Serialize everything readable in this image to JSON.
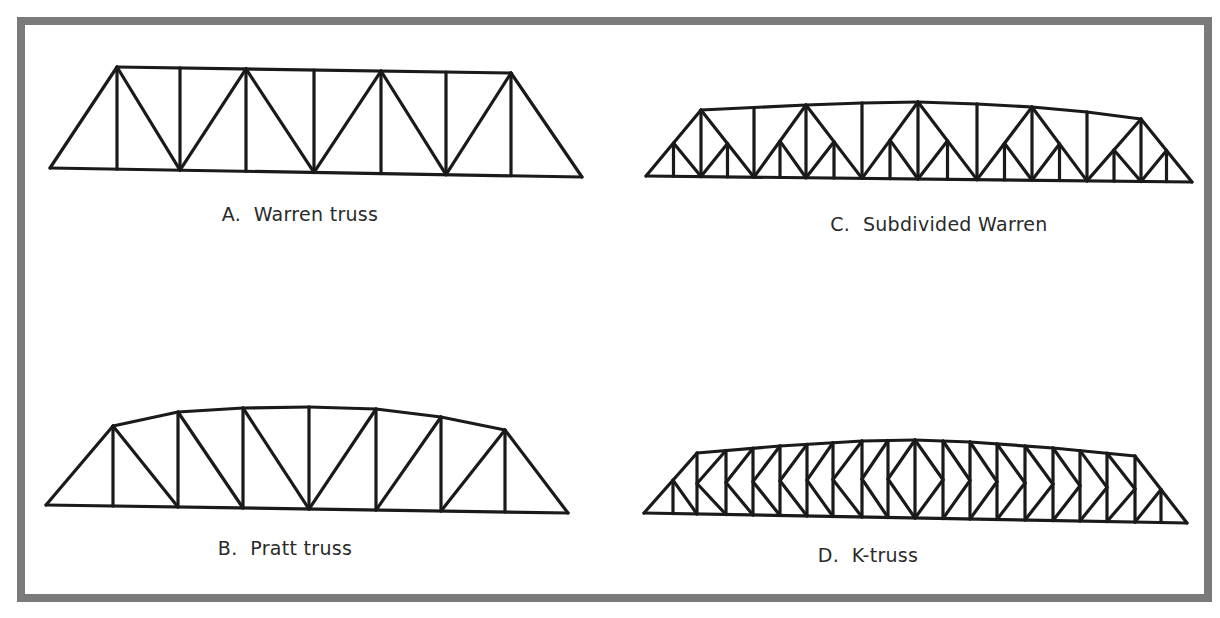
{
  "figure": {
    "border_color": "#7a7a7a",
    "line_color": "#1a1a1a",
    "trusses": [
      {
        "id": "warren",
        "letter": "A.",
        "caption": "A.  Warren truss",
        "name": "Warren truss",
        "label_pos": [
          300,
          203
        ]
      },
      {
        "id": "pratt",
        "letter": "B.",
        "caption": "B.  Pratt truss",
        "name": "Pratt truss",
        "label_pos": [
          285,
          537
        ]
      },
      {
        "id": "subdivided-warren",
        "letter": "C.",
        "caption": "C.  Subdivided Warren",
        "name": "Subdivided Warren",
        "label_pos": [
          939,
          213
        ]
      },
      {
        "id": "k-truss",
        "letter": "D.",
        "caption": "D.  K-truss",
        "name": "K-truss",
        "label_pos": [
          868,
          544
        ]
      }
    ]
  }
}
